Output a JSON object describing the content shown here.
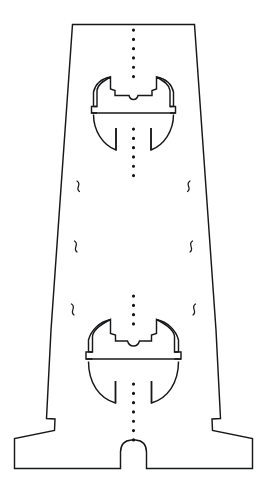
{
  "drawing": {
    "title": "Die-cut fold pattern",
    "canvas": {
      "width": 267,
      "height": 499,
      "background": "#ffffff"
    },
    "legend": {
      "cut_line_label": "cut line",
      "fold_line_label": "fold line",
      "perforation_label": "perforation",
      "break_mark_label": "break mark"
    },
    "colors": {
      "cut": "#16181a",
      "fold": "#6c7075",
      "perforation": "#111315",
      "background": "#ffffff"
    },
    "outline": {
      "name": "outer-cut-outline",
      "path": "M 72.5 24.5 L 194.5 24.5 L 216.0 330.0 L 220.5 418.5 L 212.0 419.0 L 212.5 430.5 L 252.5 438.5 L 252.5 468.5 L 146.5 468.5 L 146.5 452.0 Q 146.0 440.5 135.5 440.0 L 131.5 440.0 Q 121.0 440.5 120.5 452.0 L 120.5 468.5 L 14.5 468.5 L 14.5 438.5 L 54.5 430.5 L 55.0 419.0 L 46.5 418.5 L 51.0 330.0 Z"
    },
    "fold_lines": [
      {
        "name": "fold-line-outer-left",
        "path": "M 87.0 24.5 L 73.0 330.0 L 68.5 418.5"
      },
      {
        "name": "fold-line-inner-left",
        "path": "M 110.5 24.5 L 108.5 330.0 L 107.5 440.5"
      },
      {
        "name": "fold-line-inner-right",
        "path": "M 156.5 24.5 L 158.5 330.0 L 159.5 440.5"
      },
      {
        "name": "fold-line-outer-right",
        "path": "M 180.0 24.5 L 194.0 330.0 L 198.5 418.5"
      },
      {
        "name": "fold-line-bottom-left-diagonal",
        "path": "M 17.5 439.5 L 119.5 452.5"
      },
      {
        "name": "fold-line-bottom-right-diagonal",
        "path": "M 249.5 439.5 L 147.5 452.5"
      },
      {
        "name": "fold-line-upper-dome-horizontal",
        "path": "M 95.0 114.5 L 172.0 114.5"
      },
      {
        "name": "fold-line-lower-dome-horizontal",
        "path": "M 88.0 360.5 L 179.0 360.5"
      }
    ],
    "perforation_lines": [
      {
        "name": "perforation-top-segment",
        "path": "M 133.5 29.0 L 133.5 81.0"
      },
      {
        "name": "perforation-middle-segment",
        "path": "M 133.5 128.0 L 133.5 182.0"
      },
      {
        "name": "perforation-lower-segment",
        "path": "M 133.5 295.0 L 133.5 328.0"
      },
      {
        "name": "perforation-bottom-segment",
        "path": "M 133.5 383.0 L 133.5 446.0"
      }
    ],
    "features": [
      {
        "name": "upper-dome-cutout",
        "type": "dome-with-tabs",
        "center_x": 133.5,
        "baseline_y": 114.5,
        "radius_x": 40.5,
        "radius_y": 42.0
      },
      {
        "name": "lower-dome-cutout",
        "type": "dome-with-tabs",
        "center_x": 133.5,
        "baseline_y": 360.5,
        "radius_x": 47.0,
        "radius_y": 47.0
      }
    ],
    "break_marks": [
      {
        "name": "break-mark-left-upper",
        "cx": 66.0,
        "cy": 196.0,
        "flip": false
      },
      {
        "name": "break-mark-left-middle",
        "cx": 63.0,
        "cy": 257.0,
        "flip": false
      },
      {
        "name": "break-mark-left-lower",
        "cx": 60.0,
        "cy": 320.0,
        "flip": false
      },
      {
        "name": "break-mark-right-upper",
        "cx": 202.0,
        "cy": 196.0,
        "flip": true
      },
      {
        "name": "break-mark-right-middle",
        "cx": 205.0,
        "cy": 257.0,
        "flip": true
      },
      {
        "name": "break-mark-right-lower",
        "cx": 208.0,
        "cy": 320.0,
        "flip": true
      }
    ],
    "upper_dome_path": "M 98.0 113.5 L 94.0 113.0 L 94.0 107.5 L 97.5 107.0 L 97.5 90.5 Q 97.5 83.0 104.5 82.5 L 106.5 82.5 L 106.5 89.0 L 111.0 89.5 L 111.0 82.5 L 129.5 82.5 Q 131.0 87.5 133.5 87.5 Q 136.0 87.5 137.5 82.5 L 156.0 82.5 L 156.0 89.5 L 160.5 89.0 L 160.5 82.5 L 162.5 82.5 Q 169.5 83.0 169.5 90.5 L 169.5 107.0 L 173.0 107.5 L 173.0 113.0 L 169.0 113.5",
    "upper_dome_arc_top_left": "M 98.0 83.0 A 38.0 35.0 0 0 1 112.0 77.5",
    "upper_dome_arc_top_right": "M 169.0 83.0 A 38.0 35.0 0 0 0 155.0 77.5",
    "lower_dome_path": "M 91.0 359.5 L 86.5 359.0 L 86.5 353.0 L 90.5 352.5 L 90.5 336.0 Q 90.5 328.0 98.0 327.5 L 100.0 327.5 L 100.0 334.5 L 105.0 335.0 L 105.0 327.5 L 126.5 327.5 Q 128.5 333.5 133.5 333.5 Q 138.5 333.5 140.5 327.5 L 162.0 327.5 L 162.0 335.0 L 167.0 334.5 L 167.0 327.5 L 169.0 327.5 Q 176.5 328.0 176.5 336.0 L 176.5 352.5 L 180.5 353.0 L 180.5 359.0 L 176.0 359.5"
  }
}
